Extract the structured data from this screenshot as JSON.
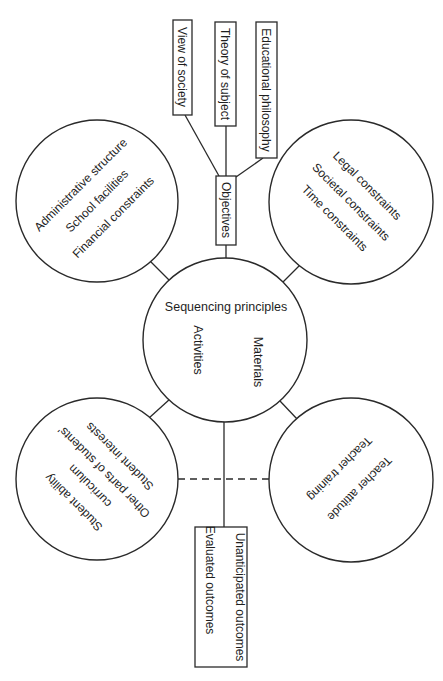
{
  "diagram": {
    "center": {
      "title": "Sequencing principles",
      "left_label": "Activities",
      "right_label": "Materials"
    },
    "objectives": {
      "label": "Objectives",
      "sources": [
        {
          "label": "View of society"
        },
        {
          "label": "Theory of subject"
        },
        {
          "label": "Educational philosophy"
        }
      ]
    },
    "circles": {
      "top_left": {
        "items": [
          "Administrative structure",
          "School facilities",
          "Financial constraints"
        ]
      },
      "top_right": {
        "items": [
          "Legal constraints",
          "Societal constraints",
          "Time constraints"
        ]
      },
      "bottom_left": {
        "items": [
          "Student ability",
          "Other parts of students'",
          "curriculum",
          "Student interests"
        ]
      },
      "bottom_right": {
        "items": [
          "Teacher attitude",
          "Teacher training"
        ]
      }
    },
    "outcomes": {
      "items": [
        "Unanticipated outcomes",
        "Evaluated outcomes"
      ]
    },
    "colors": {
      "line": "#2a2a2a",
      "text": "#1e1e1e",
      "background": "#ffffff"
    }
  }
}
